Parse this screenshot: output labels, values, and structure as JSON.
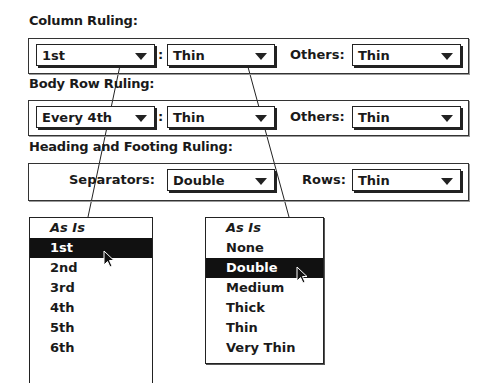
{
  "column_ruling": {
    "heading": "Column Ruling:",
    "which": "1st",
    "separator": ":",
    "weight": "Thin",
    "others_label": "Others:",
    "others": "Thin"
  },
  "body_row_ruling": {
    "heading": "Body Row Ruling:",
    "which": "Every 4th",
    "separator": ":",
    "weight": "Thin",
    "others_label": "Others:",
    "others": "Thin"
  },
  "heading_footing_ruling": {
    "heading": "Heading and Footing Ruling:",
    "separators_label": "Separators:",
    "separators": "Double",
    "rows_label": "Rows:",
    "rows": "Thin"
  },
  "which_menu": {
    "items": [
      "As Is",
      "1st",
      "2nd",
      "3rd",
      "4th",
      "5th",
      "6th"
    ],
    "selected": "1st"
  },
  "weight_menu": {
    "items": [
      "As Is",
      "None",
      "Double",
      "Medium",
      "Thick",
      "Thin",
      "Very Thin"
    ],
    "selected": "Double"
  }
}
